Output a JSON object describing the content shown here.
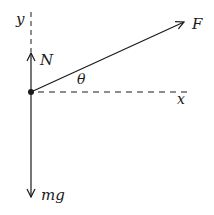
{
  "diagram": {
    "type": "free-body-diagram",
    "colors": {
      "line": "#1a1a1a",
      "background": "#ffffff"
    },
    "axes": {
      "x_label": "x",
      "y_label": "y"
    },
    "forces": [
      {
        "name": "normal",
        "label": "N",
        "direction": "up"
      },
      {
        "name": "applied",
        "label": "F",
        "direction": "up-right at angle theta"
      },
      {
        "name": "weight",
        "label": "mg",
        "direction": "down"
      }
    ],
    "angle_label": "θ"
  }
}
